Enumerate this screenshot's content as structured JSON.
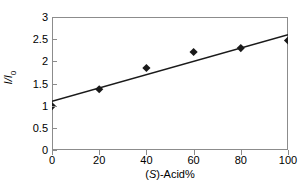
{
  "chart_data": {
    "type": "scatter",
    "title": "",
    "xlabel": "(S)-Acid%",
    "xlabel_italic_part": "S",
    "ylabel": "I/I0",
    "xlim": [
      0,
      100
    ],
    "ylim": [
      0,
      3
    ],
    "xticks": [
      0,
      20,
      40,
      60,
      80,
      100
    ],
    "yticks": [
      0,
      0.5,
      1,
      1.5,
      2,
      2.5,
      3
    ],
    "xtick_labels": [
      "0",
      "20",
      "40",
      "60",
      "80",
      "100"
    ],
    "ytick_labels": [
      "0",
      "0.5",
      "1",
      "1.5",
      "2",
      "2.5",
      "3"
    ],
    "grid": false,
    "legend": false,
    "marker": "diamond",
    "marker_color": "#1a1a1a",
    "line_color": "#1a1a1a",
    "axis_color": "#8c8c8c",
    "background": "#ffffff",
    "series": [
      {
        "name": "data",
        "x": [
          0,
          20,
          40,
          60,
          80,
          100
        ],
        "values": [
          0.99,
          1.37,
          1.85,
          2.21,
          2.3,
          2.47
        ]
      }
    ],
    "trendline": {
      "name": "linear fit",
      "x": [
        0,
        100
      ],
      "values": [
        1.1,
        2.6
      ]
    }
  }
}
